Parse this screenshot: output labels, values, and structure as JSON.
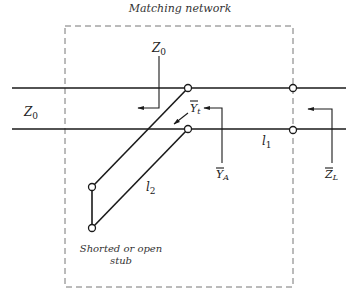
{
  "diagram": {
    "title": "Matching network",
    "labels": {
      "z0_line": "Z",
      "z0_line_sub": "0",
      "z0_top": "Z",
      "z0_top_sub": "0",
      "yt": "Y",
      "yt_sub": "t",
      "ya": "Y",
      "ya_sub": "A",
      "zl": "Z",
      "zl_sub": "L",
      "l1": "l",
      "l1_sub": "1",
      "l2": "l",
      "l2_sub": "2"
    },
    "caption_line1": "Shorted or open",
    "caption_line2": "stub",
    "colors": {
      "line": "#1a1a1a",
      "dashed_box": "#777777",
      "background": "#ffffff"
    }
  }
}
